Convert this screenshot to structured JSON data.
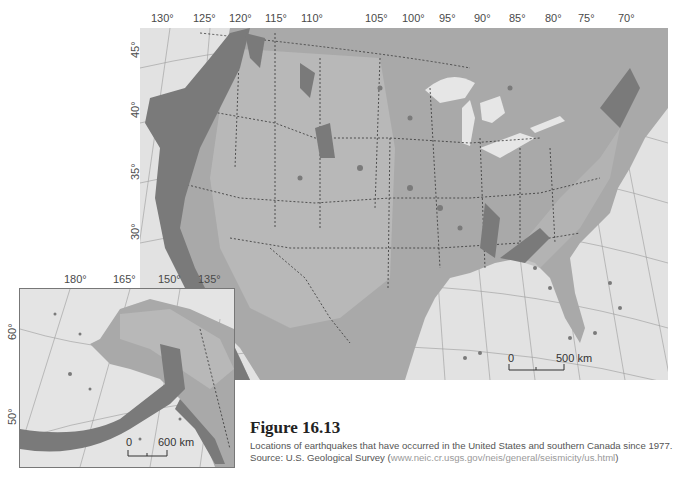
{
  "figure": {
    "number": "Figure 16.13",
    "caption_prefix": "Locations of earthquakes that have occurred in the United States and southern Canada since 1977. Source: U.S. Geological Survey (",
    "caption_link": "www.neic.cr.usgs.gov/neis/general/seismicity/us.html",
    "caption_suffix": ")"
  },
  "main_map": {
    "longitude_labels": [
      "130°",
      "125°",
      "120°",
      "115°",
      "110°",
      "105°",
      "100°",
      "95°",
      "90°",
      "85°",
      "80°",
      "75°",
      "70°"
    ],
    "latitude_labels": [
      "45°",
      "40°",
      "35°",
      "30°"
    ],
    "scale": {
      "start": "0",
      "end": "500 km"
    }
  },
  "inset_map": {
    "region": "Alaska",
    "longitude_labels": [
      "180°",
      "165°",
      "150°",
      "135°"
    ],
    "latitude_labels": [
      "60°",
      "50°"
    ],
    "scale": {
      "start": "0",
      "end": "600 km"
    }
  },
  "colors": {
    "ocean": "#e2e2e2",
    "land": "#a9a9a9",
    "relief": "#bdbdbd",
    "quake": "#7a7a7a",
    "lakes": "#e6e6e6",
    "border": "#333333"
  }
}
